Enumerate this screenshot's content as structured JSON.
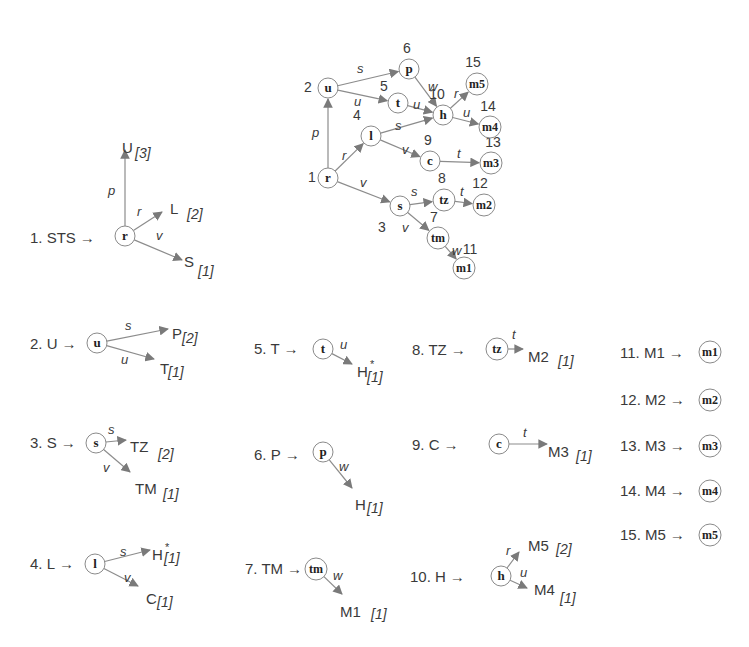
{
  "main_graph": {
    "nodes": [
      {
        "id": 1,
        "label": "r",
        "num": "1",
        "x": 328,
        "y": 178,
        "nx": -16,
        "ny": 4
      },
      {
        "id": 2,
        "label": "u",
        "num": "2",
        "x": 328,
        "y": 88,
        "nx": -20,
        "ny": 4
      },
      {
        "id": 3,
        "label": "s",
        "num": "3",
        "x": 400,
        "y": 206,
        "nx": -18,
        "ny": 26
      },
      {
        "id": 4,
        "label": "l",
        "num": "4",
        "x": 371,
        "y": 136,
        "nx": -14,
        "ny": -16
      },
      {
        "id": 5,
        "label": "t",
        "num": "5",
        "x": 398,
        "y": 103,
        "nx": -14,
        "ny": -12
      },
      {
        "id": 6,
        "label": "p",
        "num": "6",
        "x": 409,
        "y": 69,
        "nx": -2,
        "ny": -16
      },
      {
        "id": 7,
        "label": "tm",
        "num": "7",
        "x": 438,
        "y": 238,
        "nx": -4,
        "ny": -16
      },
      {
        "id": 8,
        "label": "tz",
        "num": "8",
        "x": 444,
        "y": 200,
        "nx": -2,
        "ny": -17
      },
      {
        "id": 9,
        "label": "c",
        "num": "9",
        "x": 430,
        "y": 161,
        "nx": -2,
        "ny": -16
      },
      {
        "id": 10,
        "label": "h",
        "num": "10",
        "x": 443,
        "y": 115,
        "nx": -6,
        "ny": -16
      },
      {
        "id": 11,
        "label": "m1",
        "num": "11",
        "x": 464,
        "y": 268,
        "nx": 6,
        "ny": -14
      },
      {
        "id": 12,
        "label": "m2",
        "num": "12",
        "x": 484,
        "y": 205,
        "nx": -4,
        "ny": -17
      },
      {
        "id": 13,
        "label": "m3",
        "num": "13",
        "x": 491,
        "y": 163,
        "nx": 2,
        "ny": -16
      },
      {
        "id": 14,
        "label": "m4",
        "num": "14",
        "x": 490,
        "y": 127,
        "nx": -2,
        "ny": -16
      },
      {
        "id": 15,
        "label": "m5",
        "num": "15",
        "x": 477,
        "y": 84,
        "nx": -4,
        "ny": -17
      }
    ],
    "edges": [
      {
        "from": 1,
        "to": 2,
        "label": "p",
        "lx": 312,
        "ly": 137
      },
      {
        "from": 1,
        "to": 4,
        "label": "r",
        "lx": 342,
        "ly": 160
      },
      {
        "from": 1,
        "to": 3,
        "label": "v",
        "lx": 360,
        "ly": 187
      },
      {
        "from": 2,
        "to": 6,
        "label": "s",
        "lx": 357,
        "ly": 73
      },
      {
        "from": 2,
        "to": 5,
        "label": "u",
        "lx": 354,
        "ly": 106
      },
      {
        "from": 4,
        "to": 10,
        "label": "s",
        "lx": 395,
        "ly": 130
      },
      {
        "from": 4,
        "to": 9,
        "label": "v",
        "lx": 402,
        "ly": 154
      },
      {
        "from": 5,
        "to": 10,
        "label": "u",
        "lx": 413,
        "ly": 109
      },
      {
        "from": 6,
        "to": 10,
        "label": "w",
        "lx": 428,
        "ly": 91
      },
      {
        "from": 3,
        "to": 8,
        "label": "s",
        "lx": 411,
        "ly": 196
      },
      {
        "from": 3,
        "to": 7,
        "label": "v",
        "lx": 402,
        "ly": 232
      },
      {
        "from": 9,
        "to": 13,
        "label": "t",
        "lx": 457,
        "ly": 158
      },
      {
        "from": 8,
        "to": 12,
        "label": "t",
        "lx": 460,
        "ly": 196
      },
      {
        "from": 7,
        "to": 11,
        "label": "w",
        "lx": 452,
        "ly": 255
      },
      {
        "from": 10,
        "to": 15,
        "label": "r",
        "lx": 454,
        "ly": 98
      },
      {
        "from": 10,
        "to": 14,
        "label": "u",
        "lx": 463,
        "ly": 117
      }
    ]
  },
  "rules": [
    {
      "num": "1. STS",
      "x": 30,
      "y": 243,
      "node": {
        "label": "r",
        "x": 125,
        "y": 236
      },
      "targets": [
        {
          "label": "U",
          "count": "[3]",
          "edge": "p",
          "tx": 122,
          "ty": 148,
          "ax": 125,
          "ay": 150,
          "lx": 108,
          "ly": 195,
          "cx": 135,
          "cy": 158
        },
        {
          "label": "L",
          "count": "[2]",
          "edge": "r",
          "tx": 170,
          "ty": 209,
          "ax": 162,
          "ay": 212,
          "lx": 137,
          "ly": 216,
          "cx": 187,
          "cy": 219
        },
        {
          "label": "S",
          "count": "[1]",
          "edge": "v",
          "tx": 184,
          "ty": 262,
          "ax": 182,
          "ay": 260,
          "lx": 156,
          "ly": 240,
          "cx": 198,
          "cy": 276
        }
      ]
    },
    {
      "num": "2. U",
      "x": 30,
      "y": 349,
      "node": {
        "label": "u",
        "x": 97,
        "y": 343
      },
      "targets": [
        {
          "label": "P",
          "count": "[2]",
          "edge": "s",
          "tx": 172,
          "ty": 334,
          "ax": 168,
          "ay": 329,
          "lx": 125,
          "ly": 330,
          "cx": 182,
          "cy": 343
        },
        {
          "label": "T",
          "count": "[1]",
          "edge": "u",
          "tx": 160,
          "ty": 369,
          "ax": 154,
          "ay": 359,
          "lx": 121,
          "ly": 364,
          "cx": 168,
          "cy": 377
        }
      ]
    },
    {
      "num": "3. S",
      "x": 30,
      "y": 448,
      "node": {
        "label": "s",
        "x": 96,
        "y": 443
      },
      "targets": [
        {
          "label": "TZ",
          "count": "[2]",
          "edge": "s",
          "tx": 130,
          "ty": 447,
          "ax": 126,
          "ay": 440,
          "lx": 108,
          "ly": 434,
          "cx": 158,
          "cy": 459
        },
        {
          "label": "TM",
          "count": "[1]",
          "edge": "v",
          "tx": 135,
          "ty": 489,
          "ax": 130,
          "ay": 472,
          "lx": 103,
          "ly": 472,
          "cx": 163,
          "cy": 499
        }
      ]
    },
    {
      "num": "4. L",
      "x": 30,
      "y": 569,
      "node": {
        "label": "l",
        "x": 95,
        "y": 564
      },
      "targets": [
        {
          "label": "H",
          "count": "[1]",
          "edge": "s",
          "star": true,
          "tx": 152,
          "ty": 555,
          "ax": 150,
          "ay": 550,
          "lx": 120,
          "ly": 556,
          "cx": 164,
          "cy": 563
        },
        {
          "label": "C",
          "count": "[1]",
          "edge": "v",
          "tx": 146,
          "ty": 599,
          "ax": 138,
          "ay": 586,
          "lx": 124,
          "ly": 582,
          "cx": 157,
          "cy": 607
        }
      ]
    },
    {
      "num": "5. T",
      "x": 254,
      "y": 354,
      "node": {
        "label": "t",
        "x": 323,
        "y": 349
      },
      "targets": [
        {
          "label": "H",
          "count": "[1]",
          "edge": "u",
          "star": true,
          "tx": 357,
          "ty": 372,
          "ax": 352,
          "ay": 364,
          "lx": 340,
          "ly": 349,
          "cx": 367,
          "cy": 382
        }
      ]
    },
    {
      "num": "6. P",
      "x": 254,
      "y": 460,
      "node": {
        "label": "p",
        "x": 323,
        "y": 452
      },
      "targets": [
        {
          "label": "H",
          "count": "[1]",
          "edge": "w",
          "tx": 355,
          "ty": 505,
          "ax": 352,
          "ay": 488,
          "lx": 339,
          "ly": 471,
          "cx": 367,
          "cy": 513
        }
      ]
    },
    {
      "num": "7. TM",
      "x": 245,
      "y": 574,
      "node": {
        "label": "tm",
        "x": 316,
        "y": 569
      },
      "targets": [
        {
          "label": "M1",
          "count": "[1]",
          "edge": "w",
          "tx": 340,
          "ty": 612,
          "ax": 342,
          "ay": 594,
          "lx": 333,
          "ly": 580,
          "cx": 371,
          "cy": 619
        }
      ]
    },
    {
      "num": "8. TZ",
      "x": 412,
      "y": 355,
      "node": {
        "label": "tz",
        "x": 497,
        "y": 349
      },
      "targets": [
        {
          "label": "M2",
          "count": "[1]",
          "edge": "t",
          "tx": 528,
          "ty": 357,
          "ax": 523,
          "ay": 349,
          "lx": 512,
          "ly": 339,
          "cx": 558,
          "cy": 366
        }
      ]
    },
    {
      "num": "9. C",
      "x": 412,
      "y": 450,
      "node": {
        "label": "c",
        "x": 499,
        "y": 444
      },
      "targets": [
        {
          "label": "M3",
          "count": "[1]",
          "edge": "t",
          "tx": 548,
          "ty": 452,
          "ax": 547,
          "ay": 444,
          "lx": 523,
          "ly": 437,
          "cx": 576,
          "cy": 461
        }
      ]
    },
    {
      "num": "10. H",
      "x": 410,
      "y": 582,
      "node": {
        "label": "h",
        "x": 501,
        "y": 576
      },
      "targets": [
        {
          "label": "M5",
          "count": "[2]",
          "edge": "r",
          "tx": 528,
          "ty": 546,
          "ax": 519,
          "ay": 552,
          "lx": 506,
          "ly": 555,
          "cx": 556,
          "cy": 554
        },
        {
          "label": "M4",
          "count": "[1]",
          "edge": "u",
          "tx": 534,
          "ty": 590,
          "ax": 527,
          "ay": 588,
          "lx": 520,
          "ly": 577,
          "cx": 560,
          "cy": 603
        }
      ]
    },
    {
      "num": "11. M1",
      "x": 620,
      "y": 358,
      "node": {
        "label": "m1",
        "x": 710,
        "y": 352
      },
      "targets": []
    },
    {
      "num": "12. M2",
      "x": 620,
      "y": 405,
      "node": {
        "label": "m2",
        "x": 710,
        "y": 400
      },
      "targets": []
    },
    {
      "num": "13. M3",
      "x": 620,
      "y": 451,
      "node": {
        "label": "m3",
        "x": 710,
        "y": 446
      },
      "targets": []
    },
    {
      "num": "14. M4",
      "x": 620,
      "y": 496,
      "node": {
        "label": "m4",
        "x": 710,
        "y": 491
      },
      "targets": []
    },
    {
      "num": "15. M5",
      "x": 620,
      "y": 540,
      "node": {
        "label": "m5",
        "x": 710,
        "y": 535
      },
      "targets": []
    }
  ],
  "arrow_glyph": "→",
  "star_glyph": "*",
  "colors": {
    "edge": "#8c8c8c",
    "node_stroke": "#8a8a8a",
    "text": "#3a3a3a"
  }
}
